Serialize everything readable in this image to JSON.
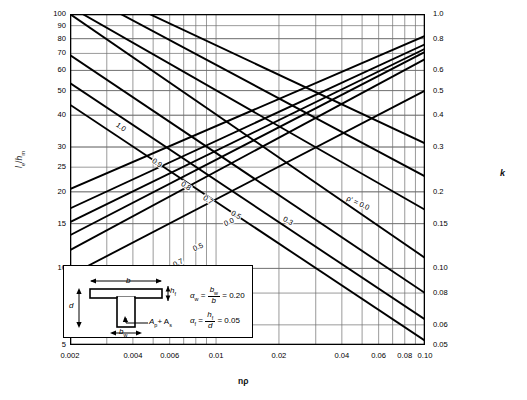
{
  "chart_data": {
    "type": "line",
    "title": "",
    "xlabel": "nρ",
    "ylabel": "lₑ/hₘ",
    "y2label": "k",
    "xscale": "log",
    "yscale": "log",
    "xlim": [
      0.002,
      0.1
    ],
    "ylim": [
      5,
      100
    ],
    "y2lim": [
      0.05,
      1.0
    ],
    "grid": true,
    "legend_position": "inline-curve-labels",
    "x_ticks": [
      "0.002",
      "0.004",
      "0.006",
      "0.01",
      "0.02",
      "0.04",
      "0.06",
      "0.08",
      "0.10"
    ],
    "x_tick_values": [
      0.002,
      0.004,
      0.006,
      0.01,
      0.02,
      0.04,
      0.06,
      0.08,
      0.1
    ],
    "y_ticks": [
      "100",
      "90",
      "80",
      "70",
      "60",
      "50",
      "40",
      "30",
      "25",
      "20",
      "15",
      "10",
      "5"
    ],
    "y_tick_values": [
      100,
      90,
      80,
      70,
      60,
      50,
      40,
      30,
      25,
      20,
      15,
      10,
      5
    ],
    "y2_ticks": [
      "1.0",
      "0.8",
      "0.6",
      "0.5",
      "0.4",
      "0.3",
      "0.2",
      "0.15",
      "0.10",
      "0.08",
      "0.06",
      "0.05"
    ],
    "y2_tick_values": [
      1.0,
      0.8,
      0.6,
      0.5,
      0.4,
      0.3,
      0.2,
      0.15,
      0.1,
      0.08,
      0.06,
      0.05
    ],
    "minor_x_gridlines": [
      0.003,
      0.005,
      0.007,
      0.008,
      0.009,
      0.03,
      0.05,
      0.07,
      0.09
    ],
    "series": [
      {
        "name": "descending-rho-1.0",
        "label": "1.0",
        "family": "descending",
        "x": [
          0.002,
          0.1
        ],
        "y": [
          100,
          11.0
        ],
        "label_x": 0.0035,
        "label_y": 36
      },
      {
        "name": "descending-rho-0.9",
        "label": "0.9",
        "family": "descending",
        "x": [
          0.002,
          0.1
        ],
        "y": [
          69,
          8.0
        ],
        "label_x": 0.0052,
        "label_y": 26
      },
      {
        "name": "descending-rho-0.8",
        "label": "0.8",
        "family": "descending",
        "x": [
          0.002,
          0.1
        ],
        "y": [
          53.5,
          6.3
        ],
        "label_x": 0.0072,
        "label_y": 21
      },
      {
        "name": "descending-rho-0.7",
        "label": "0.7",
        "family": "descending",
        "x": [
          0.002,
          0.1
        ],
        "y": [
          44.0,
          5.2
        ],
        "label_x": 0.0092,
        "label_y": 18.5
      },
      {
        "name": "descending-rho-0.5",
        "label": "0.5",
        "family": "descending",
        "x": [
          0.0023,
          0.1
        ],
        "y": [
          100,
          17.0
        ],
        "label_x": 0.0125,
        "label_y": 16.2
      },
      {
        "name": "descending-rho-0.3",
        "label": "0.3",
        "family": "descending",
        "x": [
          0.0035,
          0.1
        ],
        "y": [
          100,
          23.0
        ],
        "label_x": 0.022,
        "label_y": 15.4
      },
      {
        "name": "descending-rho-0.0",
        "label": "ρ' = 0.0",
        "family": "descending",
        "x": [
          0.0048,
          0.1
        ],
        "y": [
          100,
          31.0
        ],
        "label_x": 0.048,
        "label_y": 18.0
      }
    ],
    "k_series": [
      {
        "name": "k-curve-0.0",
        "label": "0.0",
        "family": "ascending",
        "x": [
          0.002,
          0.1
        ],
        "k": [
          0.205,
          0.82
        ],
        "label_x": 0.0115,
        "label_y_k": 0.152
      },
      {
        "name": "k-curve-0.5",
        "label": "0.5",
        "family": "ascending",
        "x": [
          0.002,
          0.1
        ],
        "k": [
          0.172,
          0.76
        ],
        "label_x": 0.0082,
        "label_y_k": 0.121
      },
      {
        "name": "k-curve-0.7",
        "label": "0.7",
        "family": "ascending",
        "x": [
          0.002,
          0.1
        ],
        "k": [
          0.152,
          0.73
        ],
        "label_x": 0.0066,
        "label_y_k": 0.105
      },
      {
        "name": "k-curve-0.8",
        "label": "0.8",
        "family": "ascending",
        "x": [
          0.002,
          0.1
        ],
        "k": [
          0.135,
          0.71
        ],
        "label_x": 0.0053,
        "label_y_k": 0.092
      },
      {
        "name": "k-curve-0.9",
        "label": "0.9",
        "family": "ascending",
        "x": [
          0.002,
          0.1
        ],
        "k": [
          0.118,
          0.665
        ],
        "label_x": 0.004,
        "label_y_k": 0.08
      },
      {
        "name": "k-curve-1.0",
        "label": "1.0",
        "family": "ascending",
        "x": [
          0.002,
          0.1
        ],
        "k": [
          0.094,
          0.5
        ],
        "label_x": 0.003,
        "label_y_k": 0.063
      }
    ]
  },
  "axes": {
    "x_label": "nρ",
    "y_label_main": "l",
    "y_label_sub": "e",
    "y_label_den": "h",
    "y_label_den_sub": "m",
    "k_label": "k"
  },
  "inset": {
    "dim_b": "b",
    "dim_d": "d",
    "dim_hf": "h",
    "dim_hf_sub": "f",
    "dim_bw": "b",
    "dim_bw_sub": "w",
    "steel_label": "A",
    "steel_label_sub": "p",
    "steel_label_plus": "+ A",
    "steel_label_sub2": "s",
    "formula1": {
      "symbol": "α",
      "symbol_sub": "w",
      "eq": "=",
      "num": "b",
      "num_sub": "w",
      "den": "b",
      "eq2": "=",
      "value": "0.20"
    },
    "formula2": {
      "symbol": "α",
      "symbol_sub": "f",
      "eq": "=",
      "num": "h",
      "num_sub": "f",
      "den": "d",
      "eq2": "=",
      "value": "0.05"
    }
  },
  "colors": {
    "curve": "#000000",
    "grid": "#6e6e6e",
    "frame": "#000000",
    "background": "#ffffff"
  }
}
